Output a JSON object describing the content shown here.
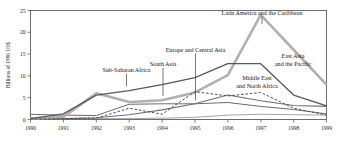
{
  "chart_data": {
    "type": "line",
    "title": "",
    "subtitle": "",
    "xlabel": "",
    "ylabel": "Billions of 1996 US$",
    "x": [
      1990,
      1991,
      1992,
      1993,
      1994,
      1995,
      1996,
      1997,
      1998,
      1999
    ],
    "xtick_labels": [
      "1990",
      "1991",
      "1992",
      "1993",
      "1994",
      "1995",
      "1996",
      "1997",
      "1998",
      "1999"
    ],
    "ytick_labels": [
      "0",
      "5",
      "10",
      "15",
      "20",
      "25"
    ],
    "yticks": [
      0,
      5,
      10,
      15,
      20,
      25
    ],
    "ylim": [
      0,
      25
    ],
    "xlim": [
      1990,
      1999
    ],
    "grid": false,
    "legend_position": "inline-annotations",
    "series": [
      {
        "name": "Latin America and the Caribbean",
        "color": "#b0b0b0",
        "style": "solid",
        "width": 2.6,
        "values": [
          0.2,
          0.6,
          6.0,
          4.0,
          4.4,
          6.2,
          10.2,
          24.0,
          16.0,
          8.0
        ]
      },
      {
        "name": "East Asia and the Pacific",
        "color": "#585858",
        "style": "solid",
        "width": 1.3,
        "values": [
          0.2,
          1.3,
          5.6,
          6.6,
          8.0,
          9.6,
          12.8,
          12.8,
          5.6,
          3.1
        ]
      },
      {
        "name": "Europe and Central Asia",
        "color": "#707070",
        "style": "solid",
        "width": 1.1,
        "values": [
          0.1,
          0.2,
          0.4,
          1.1,
          2.2,
          3.6,
          5.6,
          4.3,
          3.2,
          3.0
        ]
      },
      {
        "name": "South Asia",
        "color": "#6b6b6b",
        "style": "solid",
        "width": 1.0,
        "values": [
          1.2,
          1.0,
          0.9,
          3.5,
          3.6,
          3.6,
          3.9,
          3.0,
          2.3,
          1.3
        ]
      },
      {
        "name": "Sub-Saharan Africa",
        "color": "#9a9a9a",
        "style": "solid",
        "width": 0.9,
        "values": [
          0.2,
          0.2,
          0.2,
          0.2,
          0.3,
          0.5,
          1.0,
          1.2,
          1.1,
          1.0
        ]
      },
      {
        "name": "Middle East and North Africa",
        "color": "#4f4f4f",
        "style": "dashed",
        "width": 1.0,
        "values": [
          0.1,
          0.2,
          0.3,
          2.6,
          1.2,
          6.4,
          5.4,
          6.2,
          2.6,
          1.0
        ]
      }
    ],
    "annotations": [
      {
        "id": "latin-america",
        "text": "Latin America and the Caribbean",
        "lines": [
          "Latin America and the Caribbean"
        ]
      },
      {
        "id": "east-asia",
        "text": "East Asia and the Pacific",
        "lines": [
          "East Asia",
          "and the Pacific"
        ]
      },
      {
        "id": "europe-central-asia",
        "text": "Europe and Central Asia",
        "lines": [
          "Europe and Central Asia"
        ]
      },
      {
        "id": "south-asia",
        "text": "South Asia",
        "lines": [
          "South Asia"
        ]
      },
      {
        "id": "sub-saharan-africa",
        "text": "Sub-Saharan Africa",
        "lines": [
          "Sub-Saharan Africa"
        ]
      },
      {
        "id": "middle-east-north-africa",
        "text": "Middle East and North Africa",
        "lines": [
          "Middle East",
          "and North Africa"
        ]
      }
    ]
  },
  "axis": {
    "ylabel": "Billions of 1996 US$",
    "y0": "0",
    "y5": "5",
    "y10": "10",
    "y15": "15",
    "y20": "20",
    "y25": "25",
    "x1990": "1990",
    "x1991": "1991",
    "x1992": "1992",
    "x1993": "1993",
    "x1994": "1994",
    "x1995": "1995",
    "x1996": "1996",
    "x1997": "1997",
    "x1998": "1998",
    "x1999": "1999"
  },
  "labels": {
    "latin_america": "Latin America and the Caribbean",
    "east_asia_l1": "East Asia",
    "east_asia_l2": "and the Pacific",
    "europe_central_asia": "Europe and Central Asia",
    "south_asia": "South Asia",
    "sub_saharan_africa": "Sub-Saharan Africa",
    "middle_east_l1": "Middle East",
    "middle_east_l2": "and North Africa"
  }
}
